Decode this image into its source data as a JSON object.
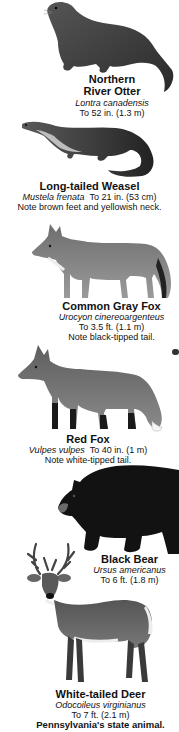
{
  "animals": [
    {
      "name_line1": "Northern",
      "name_line2": "River Otter",
      "scientific": "Lontra canadensis",
      "size": "To 52 in. (1.3 m)",
      "icon": "otter-illustration"
    },
    {
      "name": "Long-tailed Weasel",
      "scientific": "Mustela frenata",
      "size": "To 21 in. (53 cm)",
      "note": "Note brown feet and yellowish neck.",
      "icon": "weasel-illustration"
    },
    {
      "name": "Common Gray Fox",
      "scientific": "Urocyon cinereoargenteus",
      "size": "To 3.5 ft. (1.1 m)",
      "note": "Note black-tipped tail.",
      "icon": "gray-fox-illustration"
    },
    {
      "name": "Red Fox",
      "scientific": "Vulpes vulpes",
      "size": "To 40 in. (1 m)",
      "note": "Note white-tipped tail.",
      "icon": "red-fox-illustration"
    },
    {
      "name": "Black Bear",
      "scientific": "Ursus americanus",
      "size": "To 6 ft. (1.8 m)",
      "icon": "black-bear-illustration"
    },
    {
      "name": "White-tailed Deer",
      "scientific": "Odocoileus virginianus",
      "size": "To 7 ft. (2.1 m)",
      "note": "Pennsylvania's state animal.",
      "icon": "white-tailed-deer-illustration"
    }
  ]
}
